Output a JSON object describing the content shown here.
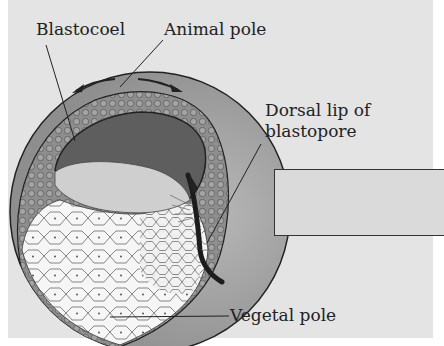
{
  "figure": {
    "labels": {
      "blastocoel": "Blastocoel",
      "animal_pole": "Animal pole",
      "dorsal_lip_line1": "Dorsal lip of",
      "dorsal_lip_line2": "blastopore",
      "vegetal_pole": "Vegetal pole"
    },
    "annotation_box": {
      "text": ""
    },
    "colors": {
      "background": "#e4e4e4",
      "animal_cells": "#8a8a8a",
      "blastocoel": "#5e5e5e",
      "vegetal_cells": "#f4f4f4",
      "outer_layer": "#a8a8a8",
      "outline": "#222222"
    }
  }
}
